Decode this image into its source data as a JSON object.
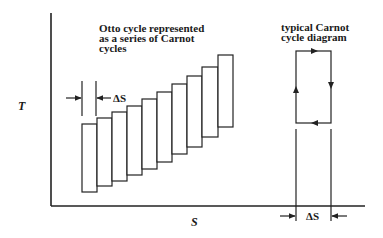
{
  "diagram": {
    "axes": {
      "y_label": "T",
      "x_label": "S"
    },
    "otto": {
      "caption": [
        "Otto cycle represented",
        "as a series of Carnot",
        "cycles"
      ],
      "delta_label": "ΔS",
      "rectangle_count": 10
    },
    "carnot": {
      "caption": [
        "typical Carnot",
        "cycle diagram"
      ],
      "delta_label": "ΔS",
      "arrows": [
        "right-on-top",
        "down-on-right",
        "left-on-bottom",
        "up-on-left"
      ]
    }
  }
}
